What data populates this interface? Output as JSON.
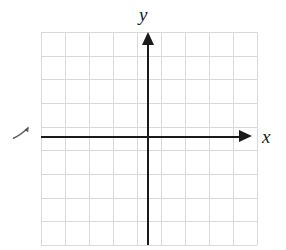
{
  "figure": {
    "background_color": "#ffffff",
    "width": 286,
    "height": 250
  },
  "axes": {
    "x_label": "x",
    "y_label": "y",
    "axis_color": "#1a1a1a",
    "x_arrow_direction": "right",
    "y_arrow_direction": "up",
    "origin": {
      "x": 148,
      "y": 137
    }
  },
  "grid": {
    "color": "#d9d9d9",
    "left": 41,
    "top": 32,
    "width": 216,
    "height": 213,
    "columns": 9,
    "rows": 9,
    "cell_width": 24,
    "cell_height": 23.67,
    "vertical_line_offsets": [
      0,
      24,
      48,
      72,
      96,
      106,
      130,
      154,
      178,
      202,
      215
    ],
    "horizontal_line_offsets": [
      0,
      23.7,
      47.3,
      71,
      94.7,
      104.5,
      128.2,
      151.8,
      175.5,
      199.2,
      212
    ]
  },
  "marks": {
    "left_stray_arrow": "small-arrow-mark"
  },
  "chart_data": {
    "type": "scatter",
    "title": "",
    "xlabel": "x",
    "ylabel": "y",
    "series": [],
    "x": [],
    "values": [],
    "xlim": [
      -4.5,
      4.5
    ],
    "ylim": [
      -4.5,
      4.5
    ],
    "grid": true,
    "legend": false,
    "note": "Empty coordinate plane with no plotted data points"
  }
}
